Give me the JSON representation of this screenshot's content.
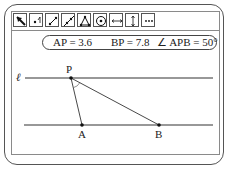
{
  "toolbar": {
    "tools": [
      {
        "name": "select-arrow-icon",
        "label": "Select"
      },
      {
        "name": "point-icon",
        "label": "Point"
      },
      {
        "name": "segment-icon",
        "label": "Segment"
      },
      {
        "name": "line-icon",
        "label": "Line"
      },
      {
        "name": "polygon-icon",
        "label": "Polygon"
      },
      {
        "name": "circle-icon",
        "label": "Circle"
      },
      {
        "name": "parallel-icon",
        "label": "Parallel"
      },
      {
        "name": "perpendicular-icon",
        "label": "Perpendicular"
      },
      {
        "name": "more-icon",
        "label": "More"
      }
    ]
  },
  "measurements": {
    "ap": "AP = 3.6",
    "bp": "BP = 7.8",
    "angle": "∠ APB = 50°"
  },
  "geometry": {
    "line_label": "ℓ",
    "points": {
      "P": {
        "label": "P"
      },
      "A": {
        "label": "A"
      },
      "B": {
        "label": "B"
      }
    }
  },
  "colors": {
    "stroke": "#333333",
    "frame": "#555555",
    "panel_border": "#8a8a8a"
  }
}
